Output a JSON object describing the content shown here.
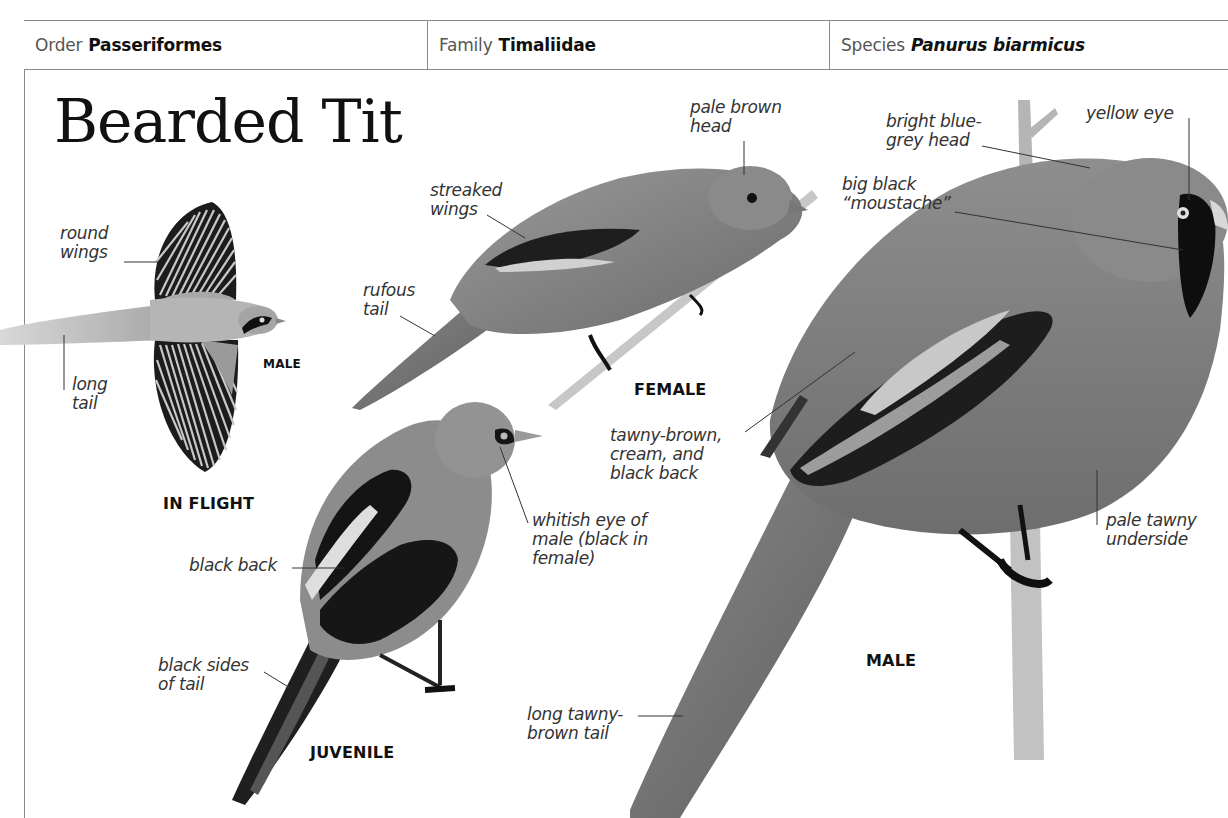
{
  "header": {
    "order": {
      "key": "Order",
      "value": "Passeriformes"
    },
    "family": {
      "key": "Family",
      "value": "Timaliidae"
    },
    "species": {
      "key": "Species",
      "value": "Panurus biarmicus"
    }
  },
  "title": "Bearded Tit",
  "figures": {
    "in_flight": {
      "caption": "IN FLIGHT",
      "sex_caption": "MALE",
      "labels": {
        "round_wings": "round\nwings",
        "long_tail": "long\ntail"
      }
    },
    "female": {
      "caption": "FEMALE",
      "labels": {
        "pale_brown_head": "pale brown\nhead",
        "streaked_wings": "streaked\nwings",
        "rufous_tail": "rufous\ntail"
      }
    },
    "juvenile": {
      "caption": "JUVENILE",
      "labels": {
        "whitish_eye": "whitish eye of\nmale (black in\nfemale)",
        "black_back": "black back",
        "black_sides_of_tail": "black sides\nof tail"
      }
    },
    "male": {
      "caption": "MALE",
      "labels": {
        "blue_grey_head": "bright blue-\ngrey head",
        "yellow_eye": "yellow eye",
        "moustache": "big black\n“moustache”",
        "back": "tawny-brown,\ncream, and\nblack back",
        "underside": "pale tawny\nunderside",
        "tail": "long tawny-\nbrown tail"
      }
    }
  },
  "colors": {
    "border": "#8a8a8a",
    "text": "#333333",
    "bird_body": "#7d7d7d",
    "bird_dark": "#1a1a1a"
  }
}
